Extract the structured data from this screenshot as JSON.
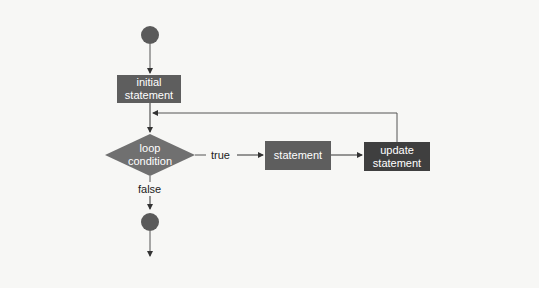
{
  "diagram": {
    "type": "for-loop flowchart",
    "nodes": {
      "start": {
        "shape": "circle"
      },
      "initial": {
        "line1": "initial",
        "line2": "statement"
      },
      "condition": {
        "line1": "loop",
        "line2": "condition"
      },
      "statement": {
        "label": "statement"
      },
      "update": {
        "line1": "update",
        "line2": "statement"
      },
      "end": {
        "shape": "circle"
      }
    },
    "edges": {
      "true_label": "true",
      "false_label": "false"
    },
    "colors": {
      "circle": "#5a5a5a",
      "box": "#5e5e5e",
      "diamond": "#707070",
      "update_box": "#3f3f3f",
      "line": "#333333",
      "background": "#f7f7f5"
    }
  }
}
